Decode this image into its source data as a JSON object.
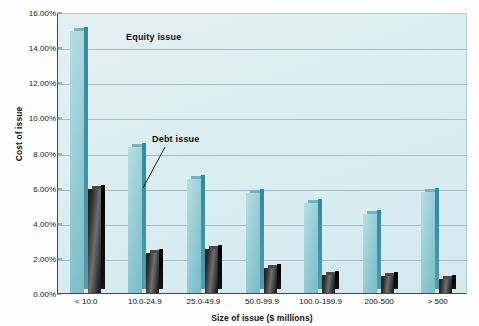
{
  "chart_data": {
    "type": "bar",
    "title": "",
    "xlabel": "Size of issue ($ millions)",
    "ylabel": "Cost of issue",
    "categories": [
      "< 10.0",
      "10.0-24.9",
      "25.0-49.9",
      "50.0-99.9",
      "100.0-199.9",
      "200-500",
      "> 500"
    ],
    "series": [
      {
        "name": "Equity issue",
        "values": [
          14.9,
          8.3,
          6.5,
          5.7,
          5.1,
          4.5,
          5.75
        ],
        "color": "#9ed0d9"
      },
      {
        "name": "Debt issue",
        "values": [
          5.9,
          2.3,
          2.5,
          1.4,
          1.0,
          0.95,
          0.8
        ],
        "color": "#2a2a2a"
      }
    ],
    "ylim": [
      0,
      16
    ],
    "ytick_values": [
      0,
      2,
      4,
      6,
      8,
      10,
      12,
      14,
      16
    ],
    "ytick_labels": [
      "0.00%",
      "2.00%",
      "4.00%",
      "6.00%",
      "8.00%",
      "10.00%",
      "12.00%",
      "14.00%",
      "16.00%"
    ],
    "grid": true,
    "legend_position": "annotations-inline",
    "annotations": [
      {
        "text": "Equity issue",
        "target": "first-equity-bar"
      },
      {
        "text": "Debt issue",
        "target": "first-debt-bar"
      }
    ],
    "plot_background": "#dceef2",
    "gridline_color": "#9fb4b9",
    "axis_color": "#3c4a4d"
  }
}
